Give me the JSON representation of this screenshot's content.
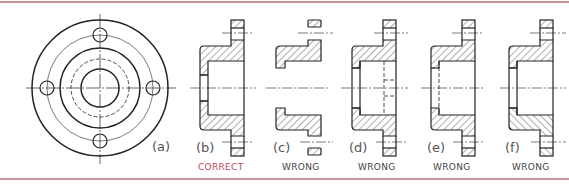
{
  "figure": {
    "colors": {
      "border": "#c9939b",
      "line": "#222222",
      "correct_caption": "#c0485a",
      "wrong_caption": "#444444",
      "view_label": "#555555"
    },
    "views": [
      {
        "id": "a",
        "label": "(a)",
        "caption": ""
      },
      {
        "id": "b",
        "label": "(b)",
        "caption": "CORRECT",
        "correct": true
      },
      {
        "id": "c",
        "label": "(c)",
        "caption": "WRONG",
        "correct": false
      },
      {
        "id": "d",
        "label": "(d)",
        "caption": "WRONG",
        "correct": false
      },
      {
        "id": "e",
        "label": "(e)",
        "caption": "WRONG",
        "correct": false
      },
      {
        "id": "f",
        "label": "(f)",
        "caption": "WRONG",
        "correct": false
      }
    ]
  }
}
